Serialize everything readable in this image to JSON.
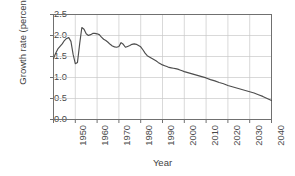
{
  "chart_data": {
    "type": "line",
    "title": "",
    "xlabel": "Year",
    "ylabel": "Growth rate (percent)",
    "xlim": [
      1950,
      2050
    ],
    "ylim": [
      0.0,
      2.5
    ],
    "ytick_labels": [
      "0.0",
      "0.5",
      "1.0",
      "1.5",
      "2.0",
      "2.5"
    ],
    "ytick_values": [
      0.0,
      0.5,
      1.0,
      1.5,
      2.0,
      2.5
    ],
    "xtick_labels": [
      "1950",
      "1960",
      "1970",
      "1980",
      "1990",
      "2000",
      "2010",
      "2020",
      "2030",
      "2040",
      "2050"
    ],
    "xtick_values": [
      1950,
      1960,
      1970,
      1980,
      1990,
      2000,
      2010,
      2020,
      2030,
      2040,
      2050
    ],
    "grid": true,
    "legend": "none",
    "line_color": "#4d4d4d",
    "grid_color": "#c8c8c8",
    "frame_color": "#707070",
    "series": [
      {
        "name": "World population growth rate",
        "x": [
          1950,
          1951,
          1952,
          1953,
          1954,
          1955,
          1956,
          1957,
          1958,
          1959,
          1960,
          1961,
          1962,
          1963,
          1964,
          1965,
          1966,
          1967,
          1968,
          1969,
          1970,
          1971,
          1972,
          1973,
          1974,
          1975,
          1976,
          1977,
          1978,
          1979,
          1980,
          1981,
          1982,
          1983,
          1984,
          1985,
          1986,
          1987,
          1988,
          1989,
          1990,
          1991,
          1992,
          1993,
          1994,
          1995,
          1996,
          1997,
          1998,
          1999,
          2000,
          2001,
          2002,
          2003,
          2004,
          2005,
          2006,
          2007,
          2008,
          2009,
          2010,
          2012,
          2014,
          2016,
          2018,
          2020,
          2022,
          2024,
          2026,
          2028,
          2030,
          2032,
          2034,
          2036,
          2038,
          2040,
          2042,
          2044,
          2046,
          2048,
          2050
        ],
        "y": [
          1.45,
          1.58,
          1.68,
          1.74,
          1.8,
          1.88,
          1.93,
          1.95,
          1.86,
          1.55,
          1.33,
          1.36,
          1.8,
          2.19,
          2.15,
          2.04,
          2.0,
          2.02,
          2.05,
          2.05,
          2.04,
          2.02,
          1.96,
          1.91,
          1.88,
          1.84,
          1.79,
          1.75,
          1.73,
          1.72,
          1.74,
          1.83,
          1.79,
          1.72,
          1.74,
          1.76,
          1.79,
          1.8,
          1.79,
          1.76,
          1.73,
          1.66,
          1.58,
          1.52,
          1.49,
          1.46,
          1.43,
          1.4,
          1.36,
          1.33,
          1.3,
          1.28,
          1.26,
          1.24,
          1.23,
          1.22,
          1.21,
          1.2,
          1.18,
          1.16,
          1.14,
          1.11,
          1.08,
          1.05,
          1.02,
          0.99,
          0.95,
          0.92,
          0.88,
          0.85,
          0.81,
          0.78,
          0.75,
          0.72,
          0.69,
          0.66,
          0.63,
          0.59,
          0.55,
          0.5,
          0.45
        ]
      }
    ]
  }
}
